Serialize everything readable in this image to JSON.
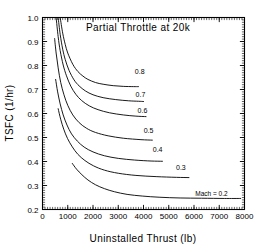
{
  "chart_data": {
    "type": "line",
    "title": "Partial Throttle at 20k",
    "xlabel": "Uninstalled Thrust (lb)",
    "ylabel": "TSFC  (1/hr)",
    "xlim": [
      0,
      8000
    ],
    "ylim": [
      0.2,
      1.0
    ],
    "xticks": [
      0,
      1000,
      2000,
      3000,
      4000,
      5000,
      6000,
      7000,
      8000
    ],
    "xtick_labels": [
      "0",
      "1000",
      "2000",
      "3000",
      "4000",
      "5000",
      "6000",
      "7000",
      "8000"
    ],
    "yticks": [
      0.2,
      0.3,
      0.4,
      0.5,
      0.6,
      0.7,
      0.8,
      0.9,
      1.0
    ],
    "ytick_labels": [
      "0.2",
      "0.3",
      "0.4",
      "0.5",
      "0.6",
      "0.7",
      "0.8",
      "0.9",
      "1.0"
    ],
    "x_minor_per_major": 10,
    "y_minor_per_major": 10,
    "grid": false,
    "legend": "inline-curve-labels",
    "legend_position": "right-end-of-each-curve",
    "series": [
      {
        "name": "0.8",
        "label": "0.8",
        "label_x": 3850,
        "label_y": 0.775,
        "points": [
          [
            700,
            1.0
          ],
          [
            800,
            0.935
          ],
          [
            900,
            0.888
          ],
          [
            1000,
            0.852
          ],
          [
            1200,
            0.805
          ],
          [
            1400,
            0.775
          ],
          [
            1600,
            0.756
          ],
          [
            1800,
            0.742
          ],
          [
            2100,
            0.729
          ],
          [
            2400,
            0.722
          ],
          [
            2800,
            0.716
          ],
          [
            3200,
            0.713
          ],
          [
            3600,
            0.712
          ],
          [
            3800,
            0.712
          ]
        ]
      },
      {
        "name": "0.7",
        "label": "0.7",
        "label_x": 3880,
        "label_y": 0.678,
        "points": [
          [
            620,
            1.0
          ],
          [
            700,
            0.93
          ],
          [
            800,
            0.868
          ],
          [
            900,
            0.825
          ],
          [
            1050,
            0.78
          ],
          [
            1250,
            0.74
          ],
          [
            1450,
            0.715
          ],
          [
            1700,
            0.694
          ],
          [
            2000,
            0.678
          ],
          [
            2400,
            0.666
          ],
          [
            2900,
            0.658
          ],
          [
            3400,
            0.653
          ],
          [
            3800,
            0.651
          ],
          [
            4000,
            0.65
          ]
        ]
      },
      {
        "name": "0.6",
        "label": "0.6",
        "label_x": 3960,
        "label_y": 0.612,
        "points": [
          [
            540,
            1.0
          ],
          [
            620,
            0.92
          ],
          [
            700,
            0.862
          ],
          [
            820,
            0.802
          ],
          [
            950,
            0.757
          ],
          [
            1120,
            0.714
          ],
          [
            1320,
            0.68
          ],
          [
            1550,
            0.654
          ],
          [
            1850,
            0.632
          ],
          [
            2200,
            0.616
          ],
          [
            2650,
            0.603
          ],
          [
            3200,
            0.594
          ],
          [
            3700,
            0.589
          ],
          [
            4100,
            0.587
          ]
        ]
      },
      {
        "name": "0.5",
        "label": "0.5",
        "label_x": 4200,
        "label_y": 0.527,
        "points": [
          [
            480,
            0.912
          ],
          [
            540,
            0.852
          ],
          [
            620,
            0.79
          ],
          [
            720,
            0.73
          ],
          [
            850,
            0.678
          ],
          [
            1000,
            0.634
          ],
          [
            1200,
            0.594
          ],
          [
            1450,
            0.562
          ],
          [
            1750,
            0.538
          ],
          [
            2100,
            0.521
          ],
          [
            2600,
            0.507
          ],
          [
            3200,
            0.497
          ],
          [
            3900,
            0.491
          ],
          [
            4350,
            0.489
          ]
        ]
      },
      {
        "name": "0.4",
        "label": "0.4",
        "label_x": 4560,
        "label_y": 0.45,
        "points": [
          [
            520,
            0.742
          ],
          [
            600,
            0.69
          ],
          [
            700,
            0.64
          ],
          [
            820,
            0.594
          ],
          [
            970,
            0.552
          ],
          [
            1150,
            0.515
          ],
          [
            1380,
            0.485
          ],
          [
            1650,
            0.46
          ],
          [
            2000,
            0.44
          ],
          [
            2450,
            0.424
          ],
          [
            3000,
            0.413
          ],
          [
            3650,
            0.406
          ],
          [
            4300,
            0.402
          ],
          [
            4750,
            0.401
          ]
        ]
      },
      {
        "name": "0.3",
        "label": "0.3",
        "label_x": 5480,
        "label_y": 0.375,
        "points": [
          [
            620,
            0.62
          ],
          [
            720,
            0.576
          ],
          [
            840,
            0.535
          ],
          [
            990,
            0.496
          ],
          [
            1180,
            0.461
          ],
          [
            1400,
            0.43
          ],
          [
            1680,
            0.404
          ],
          [
            2020,
            0.382
          ],
          [
            2450,
            0.364
          ],
          [
            3000,
            0.351
          ],
          [
            3700,
            0.342
          ],
          [
            4500,
            0.337
          ],
          [
            5300,
            0.334
          ],
          [
            5800,
            0.333
          ]
        ]
      },
      {
        "name": "Mach = 0.2",
        "label": "Mach  =  0.2",
        "label_x": 6050,
        "label_y": 0.268,
        "points": [
          [
            1180,
            0.392
          ],
          [
            1350,
            0.368
          ],
          [
            1560,
            0.345
          ],
          [
            1800,
            0.323
          ],
          [
            2100,
            0.303
          ],
          [
            2450,
            0.287
          ],
          [
            2850,
            0.274
          ],
          [
            3350,
            0.263
          ],
          [
            3950,
            0.256
          ],
          [
            4650,
            0.251
          ],
          [
            5450,
            0.248
          ],
          [
            6300,
            0.247
          ],
          [
            7200,
            0.246
          ],
          [
            7850,
            0.246
          ]
        ]
      }
    ]
  },
  "colors": {
    "background": "#ffffff",
    "foreground": "#000000",
    "curve": "#000000"
  }
}
